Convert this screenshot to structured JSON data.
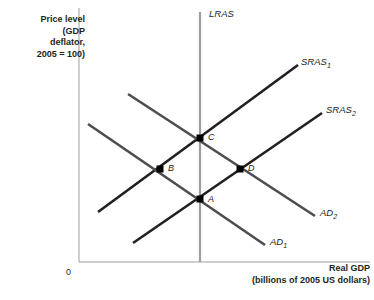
{
  "figure": {
    "axes": {
      "y_label": "Price level\n(GDP\ndeflator,\n2005 = 100)",
      "x_label": "Real GDP\n(billions of 2005 US dollars)",
      "origin": "0",
      "axis_color": "#9d9d9d"
    },
    "curves": [
      {
        "id": "LRAS",
        "label": "LRAS",
        "sub": "",
        "color": "#9d9d9d",
        "width": 2.2,
        "x1": 200,
        "y1": 12,
        "x2": 200,
        "y2": 262
      },
      {
        "id": "SRAS1",
        "label": "SRAS",
        "sub": "1",
        "color": "#231f20",
        "width": 2.6,
        "x1": 98,
        "y1": 212,
        "x2": 298,
        "y2": 65
      },
      {
        "id": "SRAS2",
        "label": "SRAS",
        "sub": "2",
        "color": "#231f20",
        "width": 2.6,
        "x1": 133,
        "y1": 243,
        "x2": 322,
        "y2": 113
      },
      {
        "id": "AD1",
        "label": "AD",
        "sub": "1",
        "color": "#4d4d4d",
        "width": 2.6,
        "x1": 88,
        "y1": 124,
        "x2": 265,
        "y2": 245
      },
      {
        "id": "AD2",
        "label": "AD",
        "sub": "2",
        "color": "#4d4d4d",
        "width": 2.6,
        "x1": 128,
        "y1": 94,
        "x2": 315,
        "y2": 216
      }
    ],
    "points": [
      {
        "id": "A",
        "label": "A",
        "x": 200,
        "y": 199
      },
      {
        "id": "B",
        "label": "B",
        "x": 160,
        "y": 169
      },
      {
        "id": "C",
        "label": "C",
        "x": 200,
        "y": 138
      },
      {
        "id": "D",
        "label": "D",
        "x": 240,
        "y": 169
      }
    ]
  },
  "chart_data": {
    "type": "line",
    "xlabel": "Real GDP (billions of 2005 US dollars)",
    "ylabel": "Price level (GDP deflator, 2005 = 100)",
    "grid": false,
    "legend": "inline curve labels",
    "series": [
      {
        "name": "LRAS",
        "kind": "vertical",
        "x": [
          200,
          200
        ],
        "y": [
          12,
          262
        ]
      },
      {
        "name": "SRAS1",
        "kind": "upward-sloping",
        "x": [
          98,
          298
        ],
        "y": [
          212,
          65
        ]
      },
      {
        "name": "SRAS2",
        "kind": "upward-sloping",
        "x": [
          133,
          322
        ],
        "y": [
          243,
          113
        ]
      },
      {
        "name": "AD1",
        "kind": "downward-sloping",
        "x": [
          88,
          265
        ],
        "y": [
          124,
          245
        ]
      },
      {
        "name": "AD2",
        "kind": "downward-sloping",
        "x": [
          128,
          315
        ],
        "y": [
          94,
          216
        ]
      }
    ],
    "annotations": [
      {
        "text": "A",
        "note": "AD1 x SRAS2 x LRAS",
        "x": 200,
        "y": 199
      },
      {
        "text": "B",
        "note": "AD1 x SRAS1",
        "x": 160,
        "y": 169
      },
      {
        "text": "C",
        "note": "AD2 x SRAS1 x LRAS",
        "x": 200,
        "y": 138
      },
      {
        "text": "D",
        "note": "AD2 x SRAS2",
        "x": 240,
        "y": 169
      }
    ]
  }
}
